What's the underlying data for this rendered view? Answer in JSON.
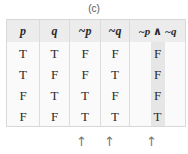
{
  "caption": "(c)",
  "table": {
    "headers": [
      "p",
      "q",
      "~p",
      "~q",
      "~p ∧ ~q"
    ],
    "rows": [
      [
        "T",
        "T",
        "F",
        "F",
        "F"
      ],
      [
        "T",
        "F",
        "F",
        "T",
        "F"
      ],
      [
        "F",
        "T",
        "T",
        "F",
        "F"
      ],
      [
        "F",
        "F",
        "T",
        "T",
        "T"
      ]
    ]
  },
  "arrows": [
    "↑",
    "↑",
    "↑"
  ],
  "colors": {
    "header_bg": "#ececec",
    "highlight": "#e6e6e6",
    "border": "#d8d8d8"
  }
}
